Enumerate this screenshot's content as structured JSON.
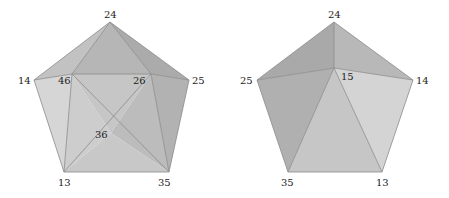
{
  "colors": {
    "edge": "#8a8a8a",
    "face_light": "#d6d6d6",
    "face_mid": "#c4c4c4",
    "face_dark": "#b0b0b0",
    "face_darker": "#a6a6a6",
    "label": "#222222"
  },
  "left_pentagon": {
    "labels": {
      "top": "24",
      "left": "14",
      "right": "25",
      "bottom_left": "13",
      "bottom_right": "35",
      "inner_left": "46",
      "inner_right": "26",
      "inner_center": "36"
    }
  },
  "right_pentagon": {
    "labels": {
      "top": "24",
      "left": "25",
      "right": "14",
      "bottom_left": "35",
      "bottom_right": "13",
      "inner_center": "15"
    }
  }
}
